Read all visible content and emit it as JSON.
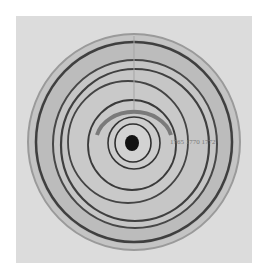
{
  "image": {
    "subject": "concentric-rings-drawing",
    "annotation_text": "1765 1770 1772",
    "colors": {
      "background": "#ffffff",
      "paper": "#dcdcdc",
      "disc_fill": "#bdbdbd",
      "ring_stroke": "#4a4a4a",
      "center_dot": "#111111"
    }
  }
}
